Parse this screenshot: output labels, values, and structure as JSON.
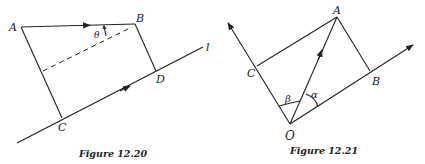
{
  "figures": [
    {
      "caption": "Figure 12.20",
      "labels": {
        "A": "A",
        "B": "B",
        "C": "C",
        "D": "D",
        "line": "l",
        "angle": "θ"
      }
    },
    {
      "caption": "Figure 12.21",
      "labels": {
        "O": "O",
        "A": "A",
        "B": "B",
        "C": "C",
        "alpha": "α",
        "beta": "β"
      }
    }
  ]
}
